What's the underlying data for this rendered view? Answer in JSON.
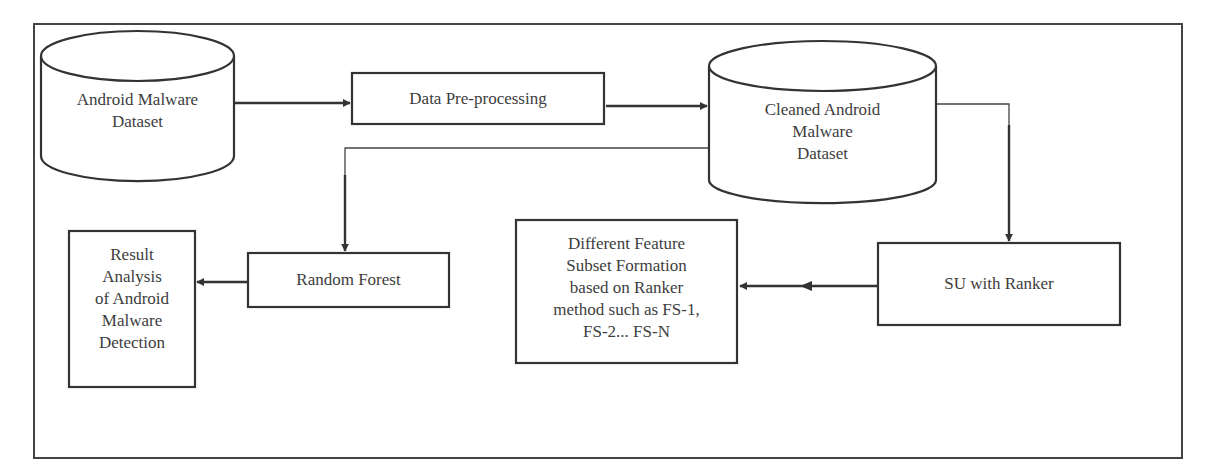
{
  "diagram": {
    "type": "flowchart",
    "title": "",
    "colors": {
      "stroke": "#333333",
      "text": "#3d3d3d",
      "background": "#ffffff"
    },
    "nodes": [
      {
        "id": "android_dataset",
        "shape": "cylinder",
        "label": "Android Malware\nDataset"
      },
      {
        "id": "preprocessing",
        "shape": "rectangle",
        "label": "Data Pre-processing"
      },
      {
        "id": "cleaned_dataset",
        "shape": "cylinder",
        "label": "Cleaned Android\nMalware\nDataset"
      },
      {
        "id": "su_ranker",
        "shape": "rectangle",
        "label": "SU with Ranker"
      },
      {
        "id": "feature_subsets",
        "shape": "rectangle",
        "label": "Different Feature\nSubset Formation\nbased on Ranker\nmethod such as FS-1,\nFS-2... FS-N"
      },
      {
        "id": "random_forest",
        "shape": "rectangle",
        "label": "Random Forest"
      },
      {
        "id": "result_analysis",
        "shape": "rectangle",
        "label": "Result\nAnalysis\nof Android\nMalware\nDetection"
      }
    ],
    "edges": [
      {
        "from": "android_dataset",
        "to": "preprocessing",
        "style": "solid-thick"
      },
      {
        "from": "preprocessing",
        "to": "cleaned_dataset",
        "style": "solid-thick"
      },
      {
        "from": "cleaned_dataset",
        "to": "su_ranker",
        "style": "solid-thin-then-thick"
      },
      {
        "from": "su_ranker",
        "to": "feature_subsets",
        "style": "solid-thick-double-arrowhead"
      },
      {
        "from": "cleaned_dataset",
        "to": "random_forest",
        "style": "solid-thin-then-thick"
      },
      {
        "from": "random_forest",
        "to": "result_analysis",
        "style": "solid-thick"
      }
    ]
  }
}
